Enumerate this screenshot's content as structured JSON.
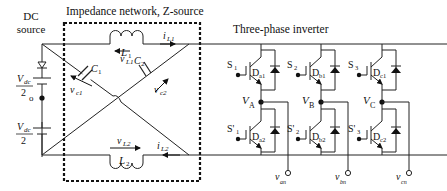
{
  "titles": {
    "dc_source_line1": "DC",
    "dc_source_line2": "source",
    "impedance": "Impedance network, Z-source",
    "inverter": "Three-phase inverter"
  },
  "source": {
    "top_num": "V",
    "top_sub": "dc",
    "top_den": "2",
    "bot_num": "V",
    "bot_sub": "dc",
    "bot_den": "2",
    "midpoint": "o"
  },
  "impedance_network": {
    "L1": {
      "name": "L",
      "sub": "1",
      "voltage": "v",
      "voltage_sub": "L1",
      "current": "i",
      "current_sub": "L1"
    },
    "L2": {
      "name": "L",
      "sub": "2",
      "voltage": "v",
      "voltage_sub": "L2",
      "current": "i",
      "current_sub": "L2"
    },
    "C1": {
      "name": "C",
      "sub": "1",
      "voltage": "v",
      "voltage_sub": "c1"
    },
    "C2": {
      "name": "C",
      "sub": "2",
      "voltage": "v",
      "voltage_sub": "c2"
    }
  },
  "inverter": {
    "legs": [
      {
        "upper_switch": "S",
        "upper_sub": "1",
        "lower_switch": "S'",
        "lower_sub": "1",
        "upper_diode": "D",
        "upper_diode_sub": "a1",
        "lower_diode": "D",
        "lower_diode_sub": "a2",
        "node": "V",
        "node_sub": "A",
        "output": "v",
        "output_sub": "an"
      },
      {
        "upper_switch": "S",
        "upper_sub": "2",
        "lower_switch": "S'",
        "lower_sub": "2",
        "upper_diode": "D",
        "upper_diode_sub": "b1",
        "lower_diode": "D",
        "lower_diode_sub": "b2",
        "node": "V",
        "node_sub": "B",
        "output": "v",
        "output_sub": "bn"
      },
      {
        "upper_switch": "S",
        "upper_sub": "3",
        "lower_switch": "S'",
        "lower_sub": "3",
        "upper_diode": "D",
        "upper_diode_sub": "c1",
        "lower_diode": "D",
        "lower_diode_sub": "c2",
        "node": "V",
        "node_sub": "C",
        "output": "v",
        "output_sub": "cn"
      }
    ]
  }
}
